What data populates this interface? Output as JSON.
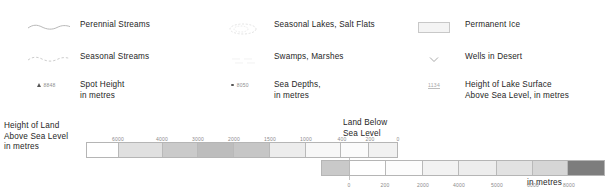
{
  "symbols": {
    "column_a": [
      {
        "icon": "perennial-stream-line-icon",
        "label": "Perennial Streams"
      },
      {
        "icon": "seasonal-stream-dashed-line-icon",
        "label": "Seasonal Streams"
      },
      {
        "icon": "spot-height-triangle-icon",
        "value": "8848",
        "label": "Spot Height\nin metres"
      }
    ],
    "column_b": [
      {
        "icon": "seasonal-lake-outline-icon",
        "label": "Seasonal Lakes, Salt Flats"
      },
      {
        "icon": "swamp-marsh-icon",
        "label": "Swamps, Marshes"
      },
      {
        "icon": "sea-depth-dot-icon",
        "value": "8050",
        "label": "Sea Depths,\nin metres"
      }
    ],
    "column_c": [
      {
        "icon": "permanent-ice-swatch-icon",
        "label": "Permanent Ice"
      },
      {
        "icon": "well-in-desert-icon",
        "label": "Wells in Desert"
      },
      {
        "icon": "lake-surface-height-icon",
        "value": "1134",
        "label": "Height of Lake Surface\nAbove Sea Level, in metres"
      }
    ]
  },
  "scales": {
    "land_caption": "Height of Land\nAbove Sea Level\nin metres",
    "below_sea_caption": "Land Below\nSea Level",
    "depth_caption": "Depth of Sea\nin metres"
  },
  "chart_data": {
    "type": "bar",
    "charts": [
      {
        "name": "height-of-land-above-sea-level",
        "ylabel": "Height of Land Above Sea Level in metres",
        "tick_labels": [
          "6000",
          "4000",
          "3000",
          "2000",
          "1500",
          "1000",
          "400",
          "200",
          "0"
        ],
        "tick_positions_px": [
          32,
          76,
          112,
          148,
          184,
          220,
          256,
          284,
          312
        ],
        "bands": [
          {
            "from": null,
            "to": "6000",
            "color": "#ffffff",
            "width_px": 32
          },
          {
            "from": "6000",
            "to": "4000",
            "color": "#e0e0e0",
            "width_px": 44
          },
          {
            "from": "4000",
            "to": "3000",
            "color": "#cacaca",
            "width_px": 36
          },
          {
            "from": "3000",
            "to": "2000",
            "color": "#bdbdbd",
            "width_px": 36
          },
          {
            "from": "2000",
            "to": "1500",
            "color": "#c6c6c6",
            "width_px": 36
          },
          {
            "from": "1500",
            "to": "1000",
            "color": "#ececec",
            "width_px": 36
          },
          {
            "from": "1000",
            "to": "400",
            "color": "#f7f7f7",
            "width_px": 36
          },
          {
            "from": "400",
            "to": "200",
            "color": "#fbfbfb",
            "width_px": 28
          },
          {
            "from": "200",
            "to": "0",
            "color": "#f1f1f1",
            "width_px": 28
          }
        ]
      },
      {
        "name": "depth-of-sea",
        "ylabel": "Depth of Sea in metres",
        "tick_labels": [
          "0",
          "200",
          "2000",
          "4000",
          "5000",
          "6000",
          "8000"
        ],
        "tick_positions_px": [
          0,
          36,
          74,
          110,
          148,
          184,
          220
        ],
        "bands": [
          {
            "from": "0",
            "to": "200",
            "color": "#ffffff",
            "width_px": 36
          },
          {
            "from": "200",
            "to": "2000",
            "color": "#fcfcfc",
            "width_px": 38
          },
          {
            "from": "2000",
            "to": "4000",
            "color": "#f2f2f2",
            "width_px": 36
          },
          {
            "from": "4000",
            "to": "5000",
            "color": "#ededed",
            "width_px": 38
          },
          {
            "from": "5000",
            "to": "6000",
            "color": "#e2e2e2",
            "width_px": 36
          },
          {
            "from": "6000",
            "to": "8000",
            "color": "#d6d6d6",
            "width_px": 36
          },
          {
            "from": "8000",
            "to": null,
            "color": "#7d7d7d",
            "width_px": 36
          }
        ]
      },
      {
        "name": "land-below-sea-level",
        "ylabel": "Land Below Sea Level",
        "tick_labels": [],
        "bands": [
          {
            "from": "0",
            "to": null,
            "color": "#c9c9c9",
            "width_px": 28
          }
        ]
      }
    ],
    "grid": false,
    "legend_position": "inline"
  }
}
